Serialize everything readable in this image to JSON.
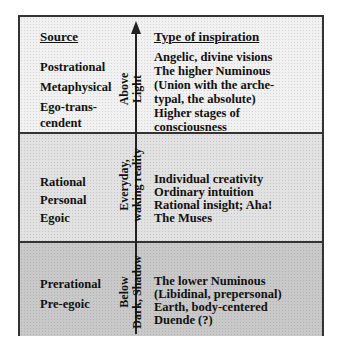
{
  "headers": {
    "source": "Source",
    "inspiration": "Type of inspiration"
  },
  "bands": [
    {
      "level": "above",
      "fill_color": "#f1f1f1",
      "axis_label_line1": "Above",
      "axis_label_line2": "Light",
      "source": [
        "Postrational",
        "Metaphysical",
        "Ego-trans-",
        "cendent"
      ],
      "inspiration": [
        "Angelic, divine visions",
        "The higher Numinous",
        "(Union with the arche-",
        "typal, the absolute)",
        "Higher stages of",
        "consciousness"
      ]
    },
    {
      "level": "everyday",
      "fill_color": "#e2e2e2",
      "axis_label_line1": "Everyday,",
      "axis_label_line2": "waking reality",
      "source": [
        "Rational",
        "Personal",
        "Egoic"
      ],
      "inspiration": [
        "Individual creativity",
        "Ordinary intuition",
        "Rational insight; Aha!",
        "The Muses"
      ]
    },
    {
      "level": "below",
      "fill_color": "#c9c9c9",
      "axis_label_line1": "Below",
      "axis_label_line2": "Dark, Shadow",
      "source": [
        "Prerational",
        "Pre-egoic"
      ],
      "inspiration": [
        "The lower Numinous",
        "(Libidinal, prepersonal)",
        "Earth, body-centered",
        "Duende (?)"
      ]
    }
  ],
  "axis": {
    "direction": "up",
    "arrow_icon": "arrow-up-icon"
  }
}
